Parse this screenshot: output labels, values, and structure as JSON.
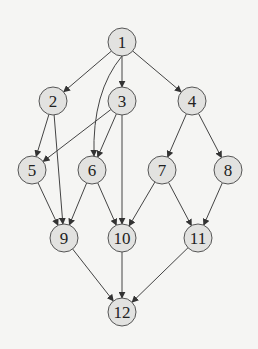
{
  "diagram": {
    "type": "directed-acyclic-graph",
    "colors": {
      "node_fill": "#e2e2e0",
      "node_stroke": "#555555",
      "edge": "#444444",
      "background": "#f5f5f3"
    },
    "nodes": [
      {
        "id": "1",
        "label": "1",
        "x": 122,
        "y": 42
      },
      {
        "id": "2",
        "label": "2",
        "x": 53,
        "y": 101
      },
      {
        "id": "3",
        "label": "3",
        "x": 122,
        "y": 101
      },
      {
        "id": "4",
        "label": "4",
        "x": 192,
        "y": 101
      },
      {
        "id": "5",
        "label": "5",
        "x": 32,
        "y": 170
      },
      {
        "id": "6",
        "label": "6",
        "x": 92,
        "y": 170
      },
      {
        "id": "7",
        "label": "7",
        "x": 162,
        "y": 170
      },
      {
        "id": "8",
        "label": "8",
        "x": 228,
        "y": 170
      },
      {
        "id": "9",
        "label": "9",
        "x": 64,
        "y": 238
      },
      {
        "id": "10",
        "label": "10",
        "x": 122,
        "y": 238
      },
      {
        "id": "11",
        "label": "11",
        "x": 198,
        "y": 238
      },
      {
        "id": "12",
        "label": "12",
        "x": 122,
        "y": 312
      }
    ],
    "edges": [
      {
        "from": "1",
        "to": "2"
      },
      {
        "from": "1",
        "to": "3"
      },
      {
        "from": "1",
        "to": "4"
      },
      {
        "from": "1",
        "to": "6",
        "curved": true
      },
      {
        "from": "2",
        "to": "5"
      },
      {
        "from": "2",
        "to": "9"
      },
      {
        "from": "3",
        "to": "5"
      },
      {
        "from": "3",
        "to": "6"
      },
      {
        "from": "3",
        "to": "10"
      },
      {
        "from": "4",
        "to": "7"
      },
      {
        "from": "4",
        "to": "8"
      },
      {
        "from": "5",
        "to": "9"
      },
      {
        "from": "6",
        "to": "9"
      },
      {
        "from": "6",
        "to": "10"
      },
      {
        "from": "7",
        "to": "10"
      },
      {
        "from": "7",
        "to": "11"
      },
      {
        "from": "8",
        "to": "11"
      },
      {
        "from": "9",
        "to": "12"
      },
      {
        "from": "10",
        "to": "12"
      },
      {
        "from": "11",
        "to": "12"
      }
    ]
  }
}
